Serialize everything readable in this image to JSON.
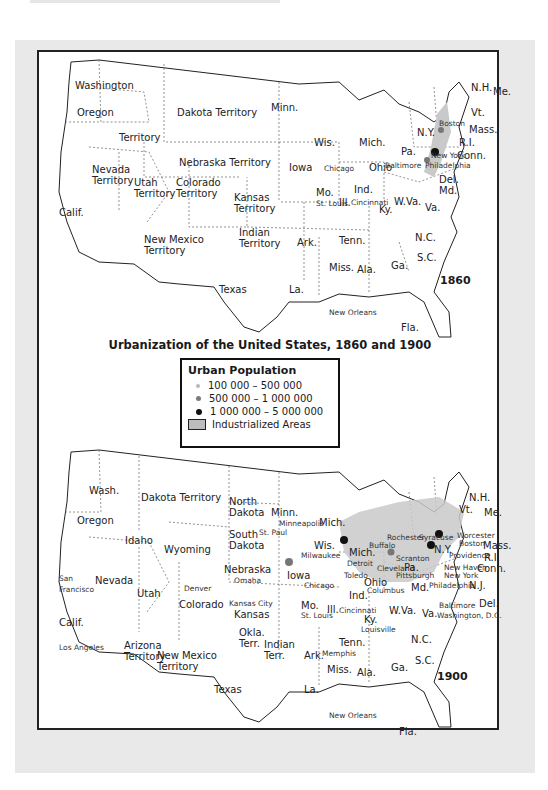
{
  "title": "Urbanization of the United States, 1860 and 1900",
  "legend": {
    "heading": "Urban Population",
    "items": [
      {
        "label": "100 000 – 500 000",
        "color": "#b8b8b8"
      },
      {
        "label": "500 000 – 1 000 000",
        "color": "#7a7a7a"
      },
      {
        "label": "1 000 000 – 5 000 000",
        "color": "#111111"
      },
      {
        "label": "Industrialized Areas",
        "color": "#bdbdbd"
      }
    ]
  },
  "map1860": {
    "year": "1860",
    "regions": [
      "Washington",
      "Oregon",
      "Dakota Territory",
      "Minn.",
      "Territory",
      "Wis.",
      "Mich.",
      "Nebraska Territory",
      "Iowa",
      "Nevada Territory",
      "Utah Territory",
      "Colorado Territory",
      "Kansas Territory",
      "Mo.",
      "Ill.",
      "Ind.",
      "Ohio",
      "Calif.",
      "New Mexico Territory",
      "Indian Territory",
      "Ark.",
      "Ky.",
      "W.Va.",
      "Va.",
      "Tenn.",
      "N.C.",
      "S.C.",
      "Texas",
      "La.",
      "Miss.",
      "Ala.",
      "Ga.",
      "Fla.",
      "N.H.",
      "Me.",
      "Vt.",
      "N.Y.",
      "Mass.",
      "R.I.",
      "Conn.",
      "Pa.",
      "Del.",
      "Md."
    ],
    "cities": [
      "Boston",
      "New York",
      "Philadelphia",
      "Baltimore",
      "Chicago",
      "Cincinnati",
      "St. Louis",
      "New Orleans"
    ]
  },
  "map1900": {
    "year": "1900",
    "regions": [
      "Wash.",
      "Oregon",
      "Idaho",
      "Dakota Territory",
      "North Dakota",
      "South Dakota",
      "Minn.",
      "Mich.",
      "Wis.",
      "Wyoming",
      "Nebraska",
      "Iowa",
      "Nevada",
      "Utah",
      "Colorado",
      "Kansas",
      "Mo.",
      "Ill.",
      "Ind.",
      "Ohio",
      "Calif.",
      "Arizona Territory",
      "New Mexico Territory",
      "Okla. Terr.",
      "Indian Terr.",
      "Ark.",
      "Ky.",
      "W.Va.",
      "Va.",
      "Tenn.",
      "N.C.",
      "S.C.",
      "Texas",
      "La.",
      "Miss.",
      "Ala.",
      "Ga.",
      "Fla.",
      "N.H.",
      "Me.",
      "Vt.",
      "N.Y.",
      "Mass.",
      "R.I.",
      "Conn.",
      "N.J.",
      "Pa.",
      "Md.",
      "Del."
    ],
    "cities": [
      "San Francisco",
      "Los Angeles",
      "Denver",
      "Omaha",
      "Kansas City",
      "Minneapolis",
      "St. Paul",
      "Milwaukee",
      "Chicago",
      "Detroit",
      "Toledo",
      "Cleveland",
      "Columbus",
      "Cincinnati",
      "Louisville",
      "St. Louis",
      "Memphis",
      "New Orleans",
      "Pittsburgh",
      "Buffalo",
      "Rochester",
      "Syracuse",
      "Scranton",
      "Worcester",
      "Boston",
      "Providence",
      "New Haven",
      "New York",
      "Philadelphia",
      "Baltimore",
      "Washington, D.C."
    ]
  }
}
